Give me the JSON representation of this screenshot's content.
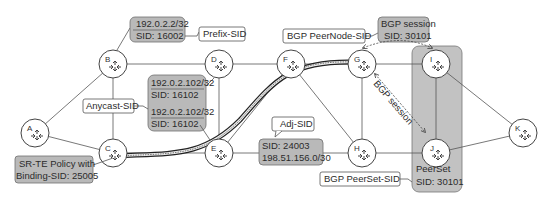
{
  "colors": {
    "gray_box": "#b9b9b9",
    "gray_box_stroke": "#6e6e6e",
    "peerset_fill": "#c2c2c2",
    "line": "#555555",
    "callout_fill": "#ffffff"
  },
  "nodes": [
    {
      "id": "A",
      "label": "A",
      "x": 35,
      "y": 133
    },
    {
      "id": "B",
      "label": "B",
      "x": 113,
      "y": 64
    },
    {
      "id": "C",
      "label": "C",
      "x": 113,
      "y": 153
    },
    {
      "id": "D",
      "label": "D",
      "x": 219,
      "y": 64
    },
    {
      "id": "E",
      "label": "E",
      "x": 219,
      "y": 153
    },
    {
      "id": "F",
      "label": "F",
      "x": 291,
      "y": 64
    },
    {
      "id": "G",
      "label": "G",
      "x": 362,
      "y": 64
    },
    {
      "id": "H",
      "label": "H",
      "x": 362,
      "y": 153
    },
    {
      "id": "I",
      "label": "I",
      "x": 436,
      "y": 64
    },
    {
      "id": "J",
      "label": "J",
      "x": 436,
      "y": 153
    },
    {
      "id": "K",
      "label": "K",
      "x": 523,
      "y": 133
    }
  ],
  "prefix_sid_box": {
    "line1": "192.0.2.2/32",
    "line2": "SID: 16002"
  },
  "prefix_sid_callout": "Prefix-SID",
  "anycast_box": {
    "line1": "192.0.2.102/32",
    "line2": "SID: 16102",
    "line3": "192.0.2.102/32",
    "line4": "SID: 16102"
  },
  "anycast_callout": "Anycast-SID",
  "adj_sid_box": {
    "line1": "SID: 24003",
    "line2": "198.51.156.0/30"
  },
  "adj_sid_callout": "Adj-SID",
  "srte_box": {
    "line1": "SR-TE Policy with",
    "line2": "Binding-SID: 25005"
  },
  "peernode_callout": "BGP PeerNode-SID",
  "bgp_session_box": {
    "line1": "BGP session",
    "line2": "SID: 30101"
  },
  "bgp_session_diag": "BGP session",
  "peerset_box": {
    "line1": "PeerSet",
    "line2": "SID: 30101"
  },
  "peerset_callout": "BGP PeerSet-SID"
}
